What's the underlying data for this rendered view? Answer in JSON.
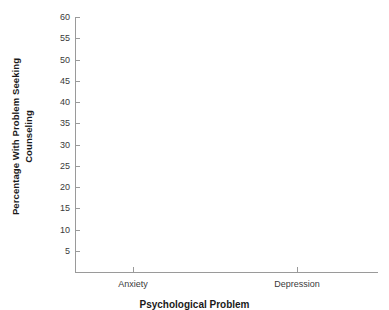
{
  "chart_data": {
    "type": "bar",
    "title": "",
    "subtitle": "",
    "xlabel": "Psychological Problem",
    "ylabel": "Percentage With Problem Seeking Counseling",
    "ylabel_line1": "Percentage With Problem Seeking",
    "ylabel_line2": "Counseling",
    "categories": [
      "Anxiety",
      "Depression"
    ],
    "values": [
      null,
      null
    ],
    "series": [],
    "ylim": [
      0,
      60
    ],
    "yticks": [
      5,
      10,
      15,
      20,
      25,
      30,
      35,
      40,
      45,
      50,
      55,
      60
    ],
    "ytick_labels": [
      "5",
      "10",
      "15",
      "20",
      "25",
      "30",
      "35",
      "40",
      "45",
      "50",
      "55",
      "60"
    ],
    "xtick_labels": [
      "Anxiety",
      "Depression"
    ],
    "grid": false,
    "legend": false,
    "legend_position": "none",
    "note": "Empty plot template: axes and labels drawn, no data series plotted",
    "annotations": []
  },
  "style": {
    "background_color": "#ffffff",
    "axis_color": "#9a9a9a",
    "tick_label_color": "#3a3a3a",
    "axis_title_color": "#1a1a1a"
  }
}
